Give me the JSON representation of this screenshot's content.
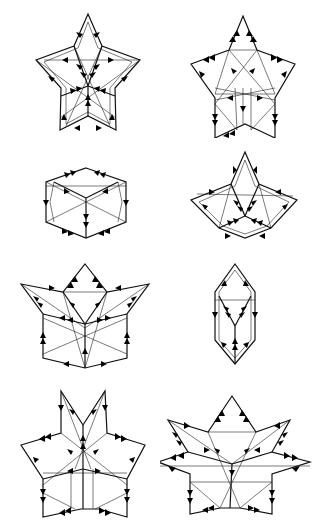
{
  "figure": {
    "type": "diagram",
    "layout": {
      "columns": 2,
      "rows": 4
    },
    "panels": [
      {
        "id": 1,
        "row": 1,
        "col": 1,
        "shape": "five-point star (pentagonal)",
        "arrow_direction": "inward toward center"
      },
      {
        "id": 2,
        "row": 1,
        "col": 2,
        "shape": "five-point star (pentagonal)",
        "arrow_direction": "outward along edges"
      },
      {
        "id": 3,
        "row": 2,
        "col": 1,
        "shape": "hexagonal box",
        "arrow_direction": "downward"
      },
      {
        "id": 4,
        "row": 2,
        "col": 2,
        "shape": "three-point fan",
        "arrow_direction": "inward toward center"
      },
      {
        "id": 5,
        "row": 3,
        "col": 1,
        "shape": "three-petal lotus",
        "arrow_direction": "outward / upward"
      },
      {
        "id": 6,
        "row": 3,
        "col": 2,
        "shape": "elongated hexagon (lens)",
        "arrow_direction": "converging to center"
      },
      {
        "id": 7,
        "row": 4,
        "col": 1,
        "shape": "six-point star with split top",
        "arrow_direction": "outward"
      },
      {
        "id": 8,
        "row": 4,
        "col": 2,
        "shape": "seven-point star",
        "arrow_direction": "outward"
      }
    ],
    "colors": {
      "line": "#111111",
      "background": "#ffffff"
    }
  }
}
